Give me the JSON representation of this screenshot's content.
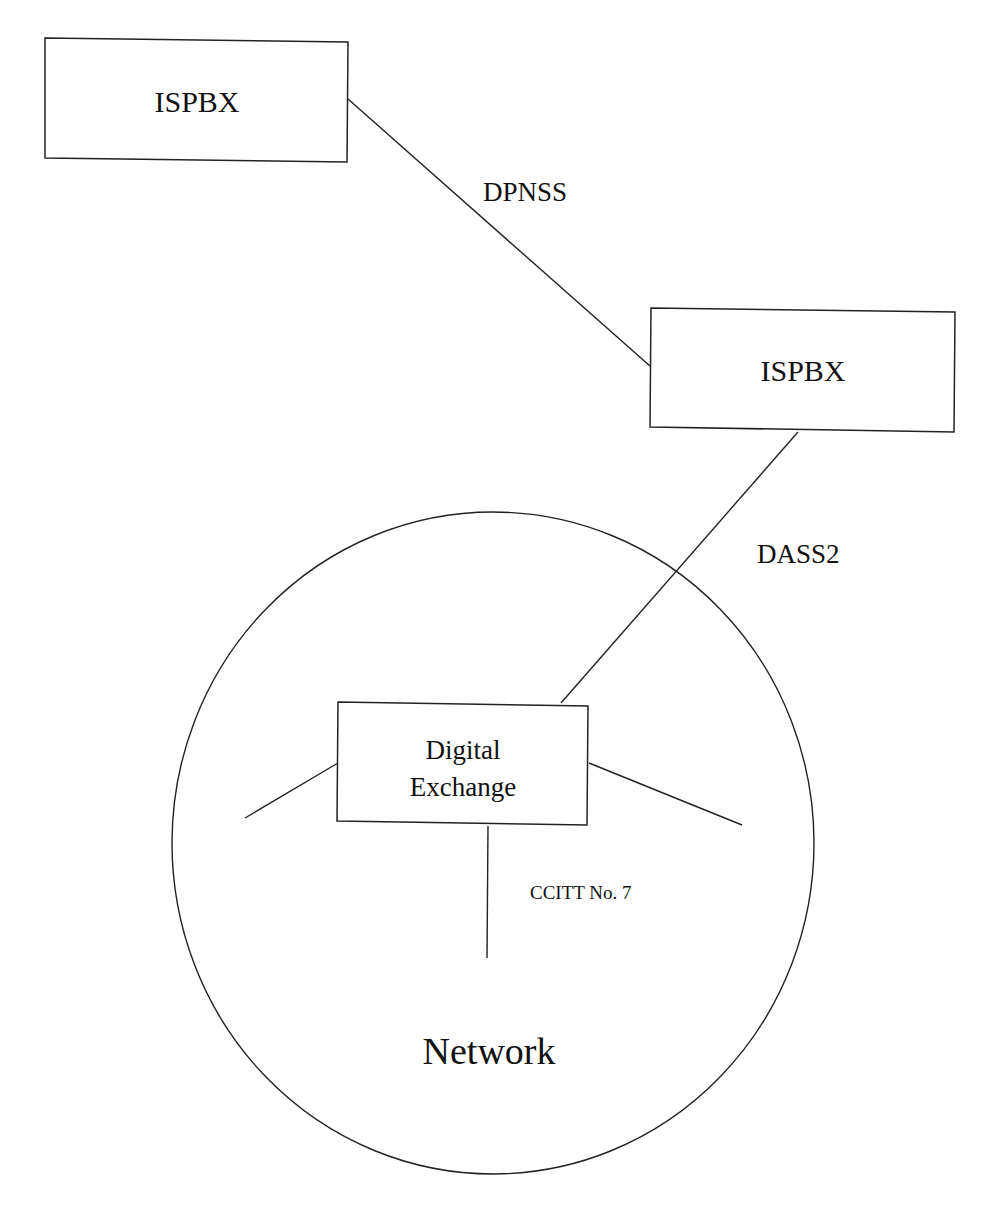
{
  "diagram": {
    "nodes": {
      "ispbx_top": {
        "label": "ISPBX"
      },
      "ispbx_right": {
        "label": "ISPBX"
      },
      "exchange": {
        "line1": "Digital",
        "line2": "Exchange"
      },
      "network": {
        "label": "Network"
      }
    },
    "links": {
      "dpnss": {
        "label": "DPNSS"
      },
      "dass2": {
        "label": "DASS2"
      },
      "ccitt": {
        "label": "CCITT No. 7"
      }
    },
    "colors": {
      "stroke": "#222222",
      "text": "#111111",
      "background": "#ffffff"
    }
  }
}
